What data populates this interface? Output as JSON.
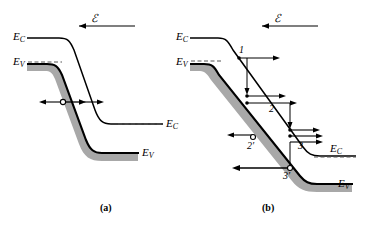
{
  "figure": {
    "kind": "semiconductor-band-diagram",
    "panels": [
      {
        "id": "a",
        "caption": "(a)",
        "field_symbol": "ℰ",
        "field_arrow_direction": "left",
        "band_labels_left": [
          {
            "text": "E",
            "sub": "C"
          },
          {
            "text": "E",
            "sub": "V"
          }
        ],
        "band_labels_right": [
          {
            "text": "E",
            "sub": "C"
          },
          {
            "text": "E",
            "sub": "V"
          }
        ],
        "carriers": [
          {
            "type": "hole",
            "glyph": "open-circle"
          }
        ],
        "arrow_count_left": 1,
        "arrow_count_right": 2
      },
      {
        "id": "b",
        "caption": "(b)",
        "field_symbol": "ℰ",
        "field_arrow_direction": "left",
        "band_labels_left": [
          {
            "text": "E",
            "sub": "C"
          },
          {
            "text": "E",
            "sub": "V"
          }
        ],
        "band_labels_right": [
          {
            "text": "E",
            "sub": "C"
          },
          {
            "text": "E",
            "sub": "V"
          }
        ],
        "electron_steps": [
          {
            "label": "1",
            "arrows": 1
          },
          {
            "label": "2",
            "arrows": 2
          },
          {
            "label": "3",
            "arrows": 3
          }
        ],
        "hole_steps": [
          {
            "label": "2′",
            "arrows": 1
          },
          {
            "label": "3′",
            "arrows": 1
          }
        ],
        "carriers": [
          {
            "type": "hole",
            "glyph": "open-circle"
          },
          {
            "type": "hole",
            "glyph": "open-circle"
          }
        ]
      }
    ],
    "colors": {
      "band_fill": "#a8a8a8",
      "line": "#000000",
      "background": "#ffffff",
      "dashed": "#555555"
    }
  }
}
